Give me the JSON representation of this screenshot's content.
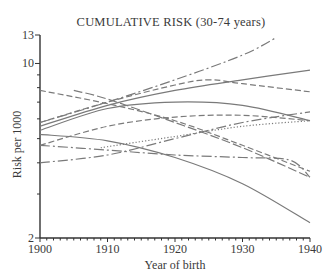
{
  "chart_data": {
    "type": "line",
    "title": "CUMULATIVE RISK (30-74 years)",
    "xlabel": "Year of birth",
    "ylabel": "Risk per 1000",
    "x_range": [
      1900,
      1940
    ],
    "y_range": [
      2,
      13
    ],
    "y_scale": "log",
    "x_ticks": [
      1900,
      1910,
      1920,
      1930,
      1940
    ],
    "y_tick_labels": [
      2,
      10,
      13
    ],
    "y_minor_ticks": [
      3,
      4,
      5,
      6,
      7,
      8,
      9
    ],
    "grid": false,
    "legend": "none",
    "series": [
      {
        "name": "series-1",
        "style": "dashdot",
        "x": [
          1900,
          1910,
          1920,
          1930,
          1935
        ],
        "values": [
          5.8,
          7.0,
          8.6,
          10.8,
          12.7
        ]
      },
      {
        "name": "series-2",
        "style": "solid",
        "x": [
          1900,
          1910,
          1920,
          1930,
          1940
        ],
        "values": [
          5.6,
          6.8,
          7.8,
          8.6,
          9.4
        ]
      },
      {
        "name": "series-3",
        "style": "dashed",
        "x": [
          1900,
          1910,
          1920,
          1925,
          1930,
          1940
        ],
        "values": [
          5.8,
          7.0,
          8.2,
          8.6,
          8.3,
          7.7
        ]
      },
      {
        "name": "series-4",
        "style": "dashed",
        "x": [
          1900,
          1910,
          1920,
          1930,
          1940
        ],
        "values": [
          7.8,
          6.9,
          5.9,
          4.7,
          3.7
        ]
      },
      {
        "name": "series-5",
        "style": "longdash",
        "x": [
          1905,
          1910,
          1920,
          1930,
          1940
        ],
        "values": [
          7.8,
          7.2,
          5.8,
          4.6,
          3.5
        ]
      },
      {
        "name": "series-6",
        "style": "solid",
        "x": [
          1900,
          1910,
          1920,
          1930,
          1940
        ],
        "values": [
          5.4,
          6.6,
          7.0,
          6.8,
          5.9
        ]
      },
      {
        "name": "series-7",
        "style": "dashed",
        "x": [
          1900,
          1910,
          1920,
          1930,
          1940
        ],
        "values": [
          4.7,
          5.6,
          6.1,
          6.2,
          5.9
        ]
      },
      {
        "name": "series-8",
        "style": "solid",
        "x": [
          1900,
          1910,
          1920,
          1930,
          1940
        ],
        "values": [
          5.2,
          4.9,
          4.2,
          3.3,
          2.3
        ]
      },
      {
        "name": "series-9",
        "style": "dashdot",
        "x": [
          1900,
          1910,
          1920,
          1930,
          1937,
          1940
        ],
        "values": [
          4.7,
          4.5,
          4.3,
          4.2,
          4.1,
          3.5
        ]
      },
      {
        "name": "series-10",
        "style": "dotted",
        "x": [
          1909,
          1920,
          1930,
          1940
        ],
        "values": [
          4.6,
          5.1,
          5.6,
          5.9
        ]
      },
      {
        "name": "series-11",
        "style": "dashdot",
        "x": [
          1900,
          1910,
          1920,
          1930,
          1940
        ],
        "values": [
          4.0,
          4.3,
          5.0,
          5.8,
          6.4
        ]
      }
    ]
  }
}
